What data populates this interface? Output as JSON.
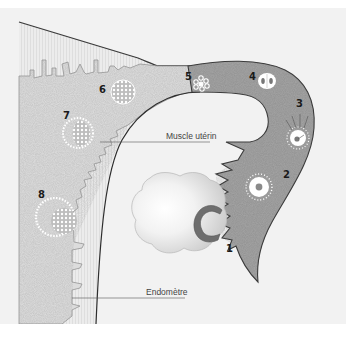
{
  "diagram": {
    "labels": {
      "muscle": "Muscle utérin",
      "endometre": "Endomètre"
    },
    "stages": [
      {
        "id": 1,
        "label": "1"
      },
      {
        "id": 2,
        "label": "2"
      },
      {
        "id": 3,
        "label": "3"
      },
      {
        "id": 4,
        "label": "4"
      },
      {
        "id": 5,
        "label": "5"
      },
      {
        "id": 6,
        "label": "6"
      },
      {
        "id": 7,
        "label": "7"
      },
      {
        "id": 8,
        "label": "8"
      }
    ],
    "colors": {
      "background": "#f1f1f1",
      "page": "#ffffff",
      "uterine_wall": "#d9d9d9",
      "endometrium_stripe": "#e4e4e4",
      "tube": "#9d9d9d",
      "outline": "#3a3a3a",
      "cell": "#ffffff",
      "ovary": "#d6d6d6",
      "ovary_highlight": "#ffffff",
      "follicle_scar": "#777777"
    }
  }
}
